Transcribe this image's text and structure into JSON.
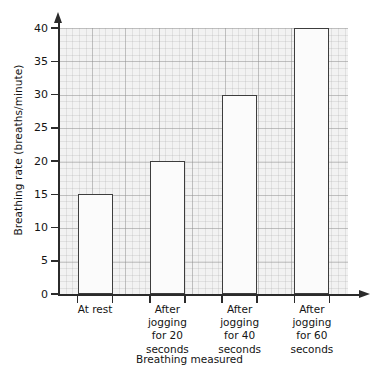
{
  "chart_data": {
    "type": "bar",
    "title": "",
    "xlabel": "Breathing measured",
    "ylabel": "Breathing rate (breaths/minute)",
    "categories": [
      "At rest",
      "After\njogging\nfor 20\nseconds",
      "After\njogging\nfor 40\nseconds",
      "After\njogging\nfor 60\nseconds"
    ],
    "values": [
      15,
      20,
      30,
      40
    ],
    "ylim": [
      0,
      40
    ],
    "ytick_labels": [
      "0",
      "5",
      "10",
      "15",
      "20",
      "25",
      "30",
      "35",
      "40"
    ],
    "ytick_values": [
      0,
      5,
      10,
      15,
      20,
      25,
      30,
      35,
      40
    ],
    "grid": true,
    "legend": "none",
    "bar_fill_color": "#fbfbfb",
    "bar_edge_color": "#3d3d3d",
    "plot_bg_color": "#f2f2f2",
    "axis_color": "#2b2b2b"
  }
}
